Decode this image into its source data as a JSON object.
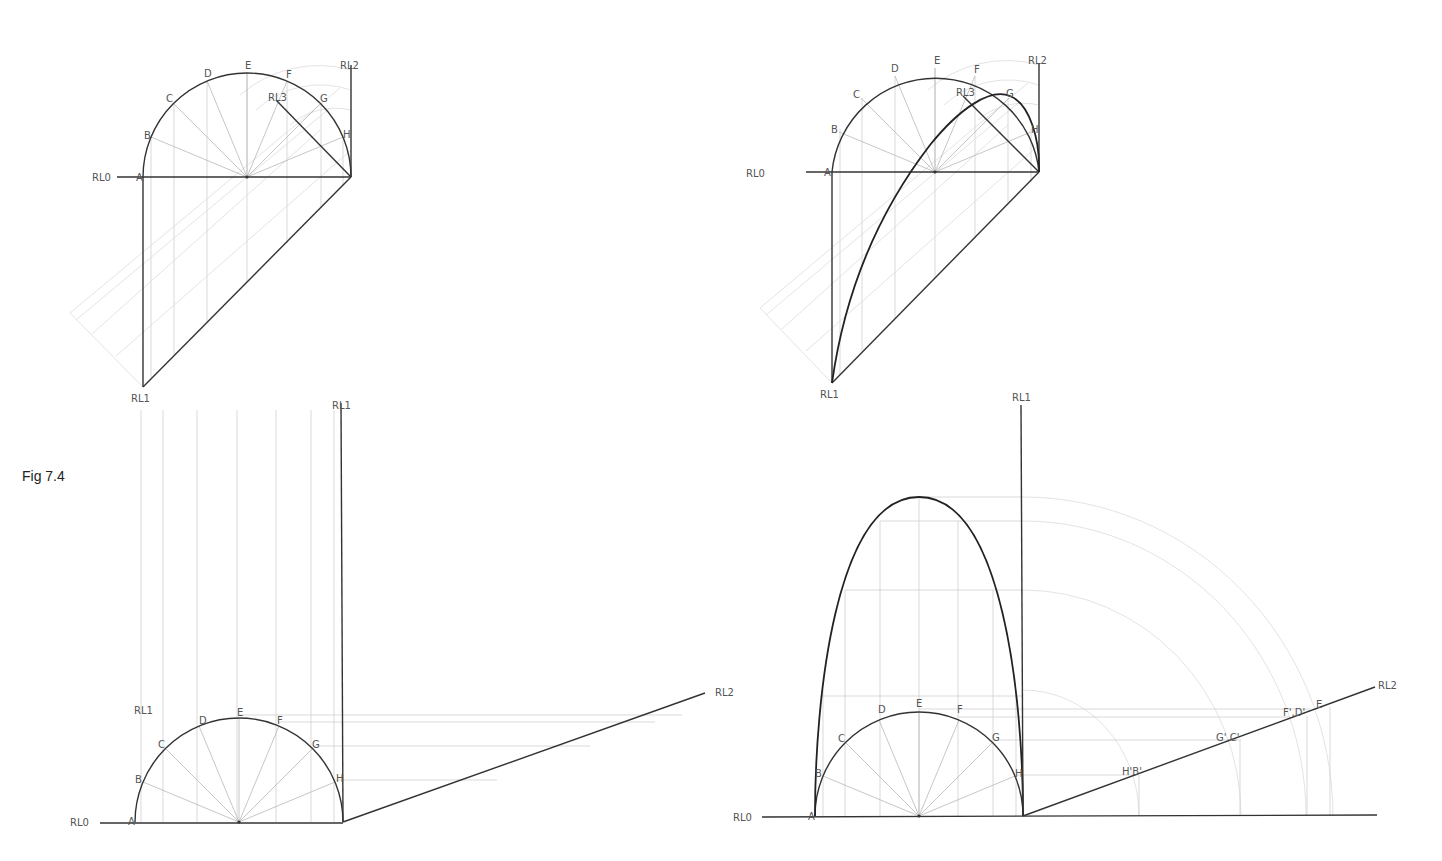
{
  "figure": {
    "caption": "Fig 7.4"
  },
  "point_labels": [
    "A",
    "B",
    "C",
    "D",
    "E",
    "F",
    "G",
    "H"
  ],
  "reference_lines": {
    "rl0": "RL0",
    "rl1": "RL1",
    "rl2": "RL2",
    "rl3": "RL3"
  },
  "panels": {
    "top_left": {
      "labels": {
        "rl0": "RL0",
        "rl1": "RL1",
        "rl2": "RL2",
        "rl3": "RL3",
        "A": "A",
        "B": "B",
        "C": "C",
        "D": "D",
        "E": "E",
        "F": "F",
        "G": "G",
        "H": "H"
      }
    },
    "top_right": {
      "labels": {
        "rl0": "RL0",
        "rl1": "RL1",
        "rl2": "RL2",
        "rl3": "RL3",
        "A": "A",
        "B": "B",
        "C": "C",
        "D": "D",
        "E": "E",
        "F": "F",
        "G": "G",
        "H": "H"
      }
    },
    "bottom_left": {
      "labels": {
        "rl0": "RL0",
        "rl1_top": "RL1",
        "rl1_side": "RL1",
        "rl2": "RL2",
        "A": "A",
        "B": "B",
        "C": "C",
        "D": "D",
        "E": "E",
        "F": "F",
        "G": "G",
        "H": "H"
      }
    },
    "bottom_right": {
      "labels": {
        "rl0": "RL0",
        "rl1": "RL1",
        "rl2": "RL2",
        "A": "A",
        "B": "B",
        "C": "C",
        "D": "D",
        "E": "E",
        "F": "F",
        "G": "G",
        "H": "H",
        "hb": "H'B'",
        "gc": "G',C'",
        "fd": "F',D'",
        "e": "E"
      }
    }
  }
}
